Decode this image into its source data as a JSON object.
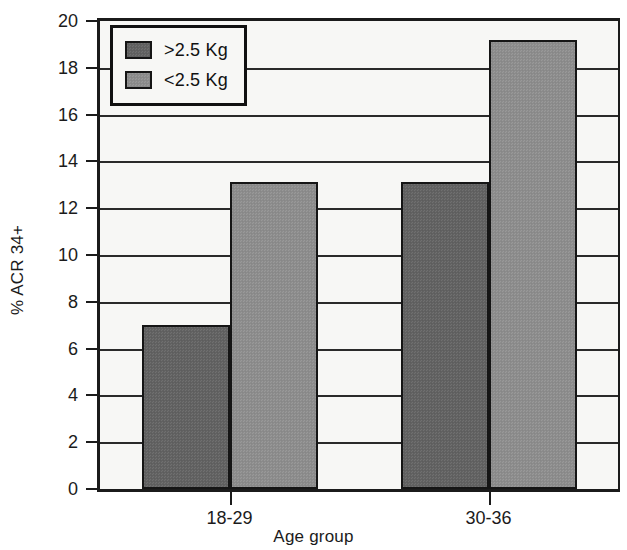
{
  "chart_data": {
    "type": "bar",
    "title": "",
    "subtitle": "",
    "xlabel": "Age group",
    "ylabel": "% ACR 34+",
    "categories": [
      "18-29",
      "30-36"
    ],
    "series": [
      {
        "name": ">2.5 Kg",
        "values": [
          7.0,
          13.1
        ],
        "color": "#636363"
      },
      {
        "name": "<2.5 Kg",
        "values": [
          13.1,
          19.2
        ],
        "color": "#8e8e8e"
      }
    ],
    "ylim": [
      0,
      20
    ],
    "ytick_values": [
      0,
      2,
      4,
      6,
      8,
      10,
      12,
      14,
      16,
      18,
      20
    ],
    "ytick_labels": [
      "0",
      "2",
      "4",
      "6",
      "8",
      "10",
      "12",
      "14",
      "16",
      "18",
      "20"
    ],
    "grid": true,
    "grid_axis": "y",
    "legend_position": "upper left",
    "plot_background": "#f7f7f5",
    "axis_color": "#1b1b1b",
    "grid_color": "#2a2a2a",
    "bar_edge_color": "#151515"
  }
}
